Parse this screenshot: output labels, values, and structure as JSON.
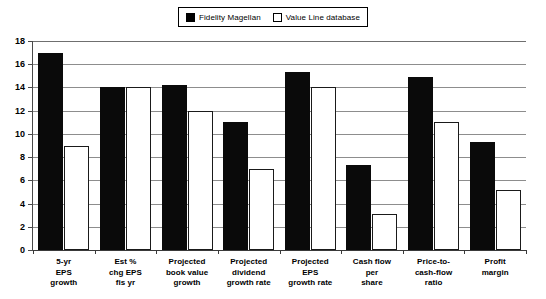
{
  "legend": {
    "position": "top-center",
    "entries": [
      {
        "label": "Fidelity Magellan",
        "swatch": "filled-square-black",
        "color": "#000000"
      },
      {
        "label": "Value Line database",
        "swatch": "hollow-square-white",
        "color": "#ffffff"
      }
    ]
  },
  "chart_data": {
    "type": "bar",
    "title": "",
    "subtitle": "",
    "xlabel": "",
    "ylabel": "",
    "ylim": [
      0,
      18
    ],
    "yticks": [
      0,
      2,
      4,
      6,
      8,
      10,
      12,
      14,
      16,
      18
    ],
    "ytick_labels": [
      "0",
      "2",
      "4",
      "6",
      "8",
      "10",
      "12",
      "14",
      "16",
      "18"
    ],
    "grid": true,
    "grid_axis": "y",
    "legend_position": "top-center",
    "categories": [
      "5-yr EPS growth",
      "Est % chg EPS fis yr",
      "Projected book value growth",
      "Projected dividend growth rate",
      "Projected EPS growth rate",
      "Cash flow per share",
      "Price-to-cash-flow ratio",
      "Profit margin"
    ],
    "category_lines": [
      [
        "5-yr",
        "EPS",
        "growth"
      ],
      [
        "Est %",
        "chg EPS",
        "fis yr"
      ],
      [
        "Projected",
        "book value",
        "growth"
      ],
      [
        "Projected",
        "dividend",
        "growth rate"
      ],
      [
        "Projected",
        "EPS",
        "growth rate"
      ],
      [
        "Cash flow",
        "per",
        "share"
      ],
      [
        "Price-to-",
        "cash-flow",
        "ratio"
      ],
      [
        "Profit",
        "margin"
      ]
    ],
    "series": [
      {
        "name": "Fidelity Magellan",
        "color": "#000000",
        "values": [
          17.0,
          14.0,
          14.2,
          11.0,
          15.3,
          7.3,
          14.9,
          9.3
        ]
      },
      {
        "name": "Value Line database",
        "color": "#ffffff",
        "values": [
          9.0,
          14.0,
          12.0,
          7.0,
          14.0,
          3.1,
          11.0,
          5.2
        ]
      }
    ]
  }
}
